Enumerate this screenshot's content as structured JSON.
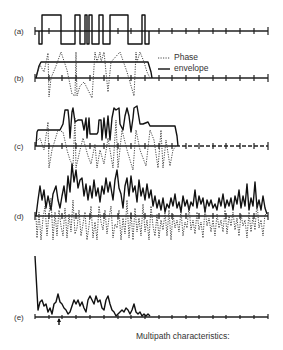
{
  "figure": {
    "panels": [
      {
        "id": "a",
        "label": "(a)"
      },
      {
        "id": "b",
        "label": "(b)"
      },
      {
        "id": "c",
        "label": "(c)"
      },
      {
        "id": "d",
        "label": "(d)"
      },
      {
        "id": "e",
        "label": "(e)"
      }
    ],
    "legend": {
      "items": [
        {
          "style": "dotted",
          "label": "Phase"
        },
        {
          "style": "solid",
          "label": "envelope"
        }
      ]
    },
    "caption": "Multipath characteristics:",
    "colors": {
      "line": "#111111",
      "background": "#ffffff"
    }
  }
}
